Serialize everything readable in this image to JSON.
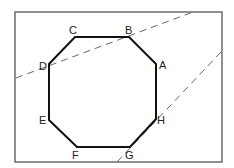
{
  "diagram": {
    "type": "octagon-with-secant-lines",
    "frame": {
      "x": 15,
      "y": 12,
      "width": 207,
      "height": 150,
      "stroke": "#555555"
    },
    "octagon": {
      "stroke": "#111111",
      "vertices": [
        {
          "name": "A",
          "x": 156,
          "y": 64
        },
        {
          "name": "B",
          "x": 129,
          "y": 37
        },
        {
          "name": "C",
          "x": 75,
          "y": 37
        },
        {
          "name": "D",
          "x": 49,
          "y": 64
        },
        {
          "name": "E",
          "x": 49,
          "y": 120
        },
        {
          "name": "F",
          "x": 77,
          "y": 147
        },
        {
          "name": "G",
          "x": 130,
          "y": 147
        },
        {
          "name": "H",
          "x": 156,
          "y": 119
        }
      ],
      "labels": [
        {
          "text": "A",
          "x": 159,
          "y": 69
        },
        {
          "text": "B",
          "x": 125,
          "y": 34
        },
        {
          "text": "C",
          "x": 69,
          "y": 34
        },
        {
          "text": "D",
          "x": 39,
          "y": 70
        },
        {
          "text": "E",
          "x": 39,
          "y": 124
        },
        {
          "text": "F",
          "x": 72,
          "y": 159
        },
        {
          "text": "G",
          "x": 125,
          "y": 159
        },
        {
          "text": "H",
          "x": 157,
          "y": 124
        }
      ]
    },
    "dashed_lines": [
      {
        "name": "line-through-D-B",
        "x1": 16,
        "y1": 78,
        "x2": 193,
        "y2": 12
      },
      {
        "name": "line-through-H-G",
        "x1": 221,
        "y1": 52,
        "x2": 116,
        "y2": 163
      }
    ]
  }
}
